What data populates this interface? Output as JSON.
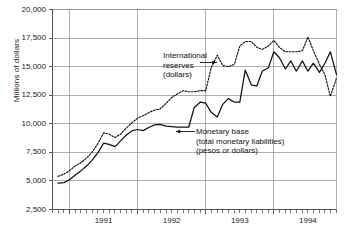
{
  "chart_data": {
    "type": "line",
    "title": "",
    "subtitle": "",
    "xlabel": "",
    "ylabel": "Millions of dollars",
    "ylim": [
      2500,
      20000
    ],
    "xlim": [
      1990.75,
      1994.92
    ],
    "grid": true,
    "legend_position": "inline-annotations",
    "ytick_labels": [
      "20,000",
      "17,500",
      "15,000",
      "12,500",
      "10,000",
      "7,500",
      "5,000",
      "2,500"
    ],
    "ytick_values": [
      20000,
      17500,
      15000,
      12500,
      10000,
      7500,
      5000,
      2500
    ],
    "xtick_labels": [
      "1991",
      "1992",
      "1993",
      "1994"
    ],
    "xtick_values": [
      1991.5,
      1992.5,
      1993.5,
      1994.5
    ],
    "x_minor_tick_interval_months": 1,
    "vertical_gridline_values": [
      1991.0,
      1992.0,
      1993.0,
      1994.0
    ],
    "x": [
      1990.83,
      1990.92,
      1991.0,
      1991.08,
      1991.17,
      1991.25,
      1991.33,
      1991.42,
      1991.5,
      1991.58,
      1991.67,
      1991.75,
      1991.83,
      1991.92,
      1992.0,
      1992.08,
      1992.17,
      1992.25,
      1992.33,
      1992.42,
      1992.5,
      1992.58,
      1992.67,
      1992.75,
      1992.83,
      1992.92,
      1993.0,
      1993.08,
      1993.17,
      1993.25,
      1993.33,
      1993.42,
      1993.5,
      1993.58,
      1993.67,
      1993.75,
      1993.83,
      1993.92,
      1994.0,
      1994.08,
      1994.17,
      1994.25,
      1994.33,
      1994.42,
      1994.5,
      1994.58,
      1994.67,
      1994.75,
      1994.83,
      1994.92
    ],
    "series": [
      {
        "name": "International reserves (dollars)",
        "style": "dotted",
        "color": "#111111",
        "values": [
          5400,
          5600,
          5900,
          6300,
          6600,
          7000,
          7500,
          8300,
          9200,
          9100,
          8800,
          9100,
          9600,
          10100,
          10500,
          10700,
          11000,
          11200,
          11300,
          11800,
          12300,
          12600,
          12900,
          12800,
          12800,
          12900,
          12900,
          14900,
          16000,
          15100,
          15000,
          15200,
          16800,
          17200,
          17200,
          16700,
          16500,
          16800,
          17300,
          16700,
          16300,
          16300,
          16300,
          16400,
          17600,
          16400,
          15200,
          14300,
          12400,
          14000
        ]
      },
      {
        "name": "Monetary base (total monetary liabilities) (pesos or dollars)",
        "style": "solid",
        "color": "#111111",
        "values": [
          4800,
          4850,
          5100,
          5500,
          5900,
          6300,
          6800,
          7500,
          8300,
          8200,
          8000,
          8500,
          9000,
          9400,
          9500,
          9400,
          9700,
          9900,
          9950,
          9800,
          9750,
          9700,
          9700,
          9700,
          11400,
          11900,
          11800,
          11000,
          10600,
          11700,
          12200,
          11900,
          11900,
          14700,
          13400,
          13300,
          14600,
          14900,
          16300,
          15800,
          14800,
          15500,
          14600,
          15500,
          14600,
          15300,
          14500,
          15300,
          16300,
          14300
        ]
      }
    ],
    "annotations": [
      {
        "name": "international-reserves-annotation",
        "lines": [
          "International",
          "reserves",
          "(dollars)"
        ],
        "arrow": "right"
      },
      {
        "name": "monetary-base-annotation",
        "lines": [
          "Monetary base",
          "(total monetary liabilities)",
          "(pesos or dollars)"
        ],
        "arrow": "left"
      }
    ]
  },
  "axes": {
    "ylabel": "Millions of dollars",
    "ytick_labels": [
      "20,000",
      "17,500",
      "15,000",
      "12,500",
      "10,000",
      "7,500",
      "5,000",
      "2,500"
    ],
    "xtick_labels": [
      "1991",
      "1992",
      "1993",
      "1994"
    ]
  },
  "annotations": {
    "reserves": {
      "line1": "International",
      "line2": "reserves",
      "line3": "(dollars)"
    },
    "base": {
      "line1": "Monetary base",
      "line2": "(total monetary liabilities)",
      "line3": "(pesos or dollars)"
    }
  },
  "colors": {
    "ink": "#111111",
    "grid": "#8c8c8c",
    "axis": "#555555",
    "background": "#ffffff"
  }
}
